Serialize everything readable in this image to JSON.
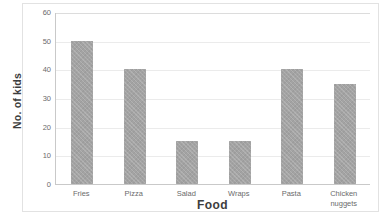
{
  "chart_data": {
    "type": "bar",
    "title": "",
    "categories": [
      "Fries",
      "Pizza",
      "Salad",
      "Wraps",
      "Pasta",
      "Chicken nuggets"
    ],
    "category_labels": [
      "Fries",
      "Pizza",
      "Salad",
      "Wraps",
      "Pasta",
      "Chicken\nnuggets"
    ],
    "values": [
      50,
      40,
      15,
      15,
      40,
      35
    ],
    "xlabel": "Food",
    "ylabel": "No. of kids",
    "ylim": [
      0,
      60
    ],
    "yticks": [
      0,
      10,
      20,
      30,
      40,
      50,
      60
    ],
    "ytick_labels": [
      "0",
      "10",
      "20",
      "30",
      "40",
      "50",
      "60"
    ],
    "grid": "horizontal",
    "legend": "none",
    "colors": {
      "bar_fill": "#a3a3a3",
      "gridline": "#ebebeb",
      "axis_line": "#c9c9c9",
      "frame": "#e2e2e2",
      "tick_text": "#6b6b6b",
      "title_text": "#3d3d3d",
      "background": "#ffffff"
    }
  }
}
